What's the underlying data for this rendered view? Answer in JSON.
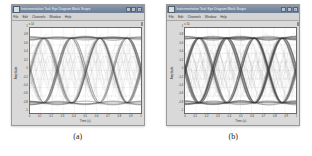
{
  "page": {
    "background": "#ffffff",
    "panel_count": 2
  },
  "panels": [
    {
      "caption": "(a)",
      "window": {
        "title": "Instrumentation Tool: Eye Diagram Block Scope",
        "icon": "scope-icon",
        "buttons": [
          {
            "name": "minimize-button",
            "glyph": "_"
          },
          {
            "name": "maximize-button",
            "glyph": "□"
          },
          {
            "name": "close-button",
            "glyph": "×"
          }
        ],
        "menu": [
          "File",
          "Edit",
          "Channels",
          "Window",
          "Help"
        ],
        "titlebar_color": "#7b8ba2",
        "frame_color": "#c8c8c8"
      },
      "chart_data": {
        "type": "line",
        "title": "",
        "subtitle": "",
        "xlabel": "Time (s)",
        "ylabel": "Amplitude",
        "y_exponent": "x 10",
        "xlim": [
          0,
          1.0
        ],
        "ylim": [
          -1.0,
          1.0
        ],
        "grid": true,
        "legend": "none",
        "xticks": [
          "0",
          "0.1",
          "0.2",
          "0.3",
          "0.4",
          "0.5",
          "0.6",
          "0.7",
          "0.8",
          "0.9",
          "1"
        ],
        "yticks": [
          "1",
          "0.8",
          "0.6",
          "0.4",
          "0.2",
          "0",
          "-0.2",
          "-0.4",
          "-0.6",
          "-0.8",
          "-1"
        ],
        "eye_count": 4,
        "trace_count": 48,
        "trace_color": "#4a4a4a",
        "description": "Eye diagram: overlaid sinusoid-like traces forming four open eyes",
        "series": [
          {
            "name": "overlaid-traces",
            "values": []
          }
        ]
      }
    },
    {
      "caption": "(b)",
      "window": {
        "title": "Instrumentation Tool: Eye Diagram Block Scope",
        "icon": "scope-icon",
        "buttons": [
          {
            "name": "minimize-button",
            "glyph": "_"
          },
          {
            "name": "maximize-button",
            "glyph": "□"
          },
          {
            "name": "close-button",
            "glyph": "×"
          }
        ],
        "menu": [
          "File",
          "Edit",
          "Channels",
          "Window",
          "Help"
        ],
        "titlebar_color": "#7b8ba2",
        "frame_color": "#c8c8c8"
      },
      "chart_data": {
        "type": "line",
        "title": "",
        "subtitle": "",
        "xlabel": "Time (s)",
        "ylabel": "Amplitude",
        "y_exponent": "x 10",
        "xlim": [
          0,
          1.0
        ],
        "ylim": [
          -1.0,
          1.0
        ],
        "grid": true,
        "legend": "none",
        "xticks": [
          "0",
          "0.1",
          "0.2",
          "0.3",
          "0.4",
          "0.5",
          "0.6",
          "0.7",
          "0.8",
          "0.9",
          "1"
        ],
        "yticks": [
          "1",
          "0.8",
          "0.6",
          "0.4",
          "0.2",
          "0",
          "-0.2",
          "-0.4",
          "-0.6",
          "-0.8",
          "-1"
        ],
        "eye_count": 4,
        "trace_count": 64,
        "trace_color": "#3f3f3f",
        "description": "Eye diagram with denser overlaid traces and more closed eye openings",
        "series": [
          {
            "name": "overlaid-traces",
            "values": []
          }
        ]
      }
    }
  ]
}
